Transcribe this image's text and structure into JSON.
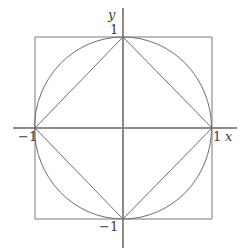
{
  "figure": {
    "name": "unit-circle-inscribed-square-diamond",
    "background_color": "#ffffff",
    "line_color": "#6e6e6e",
    "axis_color": "#8c8c8c",
    "label_color": "#3d3d3d",
    "width": 246,
    "height": 252
  },
  "axes": {
    "origin": {
      "x": 123,
      "y": 128
    },
    "x_axis": {
      "x1": 13,
      "y1": 128,
      "x2": 237,
      "y2": 128,
      "label": "x"
    },
    "y_axis": {
      "x1": 123,
      "y1": 8,
      "x2": 123,
      "y2": 248,
      "label": "y"
    }
  },
  "labels": {
    "y_axis_name": "y",
    "x_axis_name": "x",
    "y_top_tick": "1",
    "y_bottom_tick": "−1",
    "x_right_tick": "1",
    "x_left_tick": "−1"
  },
  "shapes": {
    "square": {
      "name": "circumscribed-square",
      "left": 35,
      "top": 37,
      "right": 212,
      "bottom": 219,
      "points": "35,37 212,37 212,219 35,219 35,37"
    },
    "circle": {
      "name": "unit-circle",
      "cx": 123,
      "cy": 128,
      "rx": 88.5,
      "ry": 91
    },
    "diamond": {
      "name": "inscribed-diamond",
      "vertices": [
        {
          "label": "top",
          "x": 123,
          "y": 37
        },
        {
          "label": "right",
          "x": 212,
          "y": 128
        },
        {
          "label": "bottom",
          "x": 123,
          "y": 219
        },
        {
          "label": "left",
          "x": 35,
          "y": 128
        }
      ],
      "points": "123,37 212,128 123,219 35,128 123,37"
    }
  },
  "chart_data": {
    "type": "line",
    "title": "",
    "xlabel": "x",
    "ylabel": "y",
    "xlim": [
      -1.25,
      1.3
    ],
    "ylim": [
      -1.32,
      1.32
    ],
    "grid": false,
    "legend": null,
    "xticks": [
      -1,
      1
    ],
    "xticklabels": [
      "−1",
      "1"
    ],
    "yticks": [
      -1,
      1
    ],
    "yticklabels": [
      "−1",
      "1"
    ],
    "series": [
      {
        "name": "square",
        "kind": "polygon",
        "closed": true,
        "points": [
          [
            -1,
            1
          ],
          [
            1,
            1
          ],
          [
            1,
            -1
          ],
          [
            -1,
            -1
          ]
        ]
      },
      {
        "name": "circle",
        "kind": "circle",
        "center": [
          0,
          0
        ],
        "radius": 1
      },
      {
        "name": "diamond",
        "kind": "polygon",
        "closed": true,
        "points": [
          [
            0,
            1
          ],
          [
            1,
            0
          ],
          [
            0,
            -1
          ],
          [
            -1,
            0
          ]
        ]
      }
    ]
  }
}
